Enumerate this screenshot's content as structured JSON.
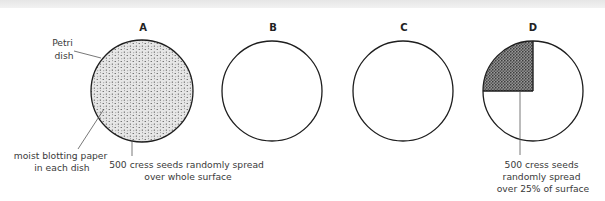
{
  "figure": {
    "dishes": [
      {
        "letter": "A",
        "cx": 142,
        "cy": 91,
        "r": 51,
        "fill": "full"
      },
      {
        "letter": "B",
        "cx": 272,
        "cy": 91,
        "r": 50,
        "fill": "none"
      },
      {
        "letter": "C",
        "cx": 403,
        "cy": 91,
        "r": 50,
        "fill": "none"
      },
      {
        "letter": "D",
        "cx": 533,
        "cy": 91,
        "r": 50,
        "fill": "quarter"
      }
    ],
    "labels": {
      "petri_dish": [
        "Petri",
        "dish"
      ],
      "blotting_paper": [
        "moist blotting paper",
        "in each dish"
      ],
      "seeds_whole": [
        "500 cress seeds randomly spread",
        "over whole surface"
      ],
      "seeds_quarter": [
        "500 cress seeds",
        "randomly spread",
        "over 25% of surface"
      ]
    },
    "colors": {
      "outline": "#1e1e1e",
      "fill_light": "#e4e4e4",
      "fill_dark": "#6a6a6a",
      "leader": "#555555",
      "top_band": "#ececec"
    }
  }
}
